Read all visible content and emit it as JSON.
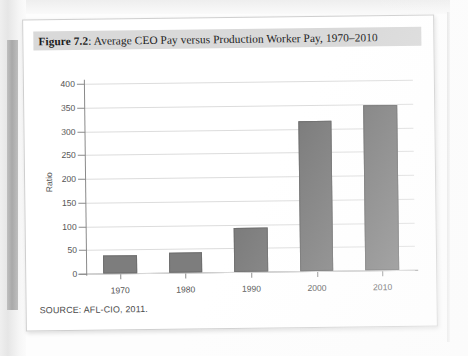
{
  "figure": {
    "label": "Figure 7.2",
    "separator": ": ",
    "caption": "Average CEO Pay versus Production Worker Pay, 1970–2010",
    "source": "SOURCE: AFL-CIO, 2011."
  },
  "colors": {
    "bar_fill": "#7d7d7d",
    "bar_edge": "#6f6f6f",
    "axis": "#8a8a8a",
    "gridline": "#dcdcdc",
    "caption_band": "#d9d9d9",
    "page": "#ffffff"
  },
  "chart_data": {
    "type": "bar",
    "title": "Average CEO Pay versus Production Worker Pay, 1970–2010",
    "xlabel": "",
    "ylabel": "Ratio",
    "categories": [
      "1970",
      "1980",
      "1990",
      "2000",
      "2010"
    ],
    "values": [
      38,
      42,
      93,
      315,
      348
    ],
    "ylim": [
      0,
      400
    ],
    "ytick_values": [
      0,
      50,
      100,
      150,
      200,
      250,
      300,
      350,
      400
    ],
    "ytick_labels": [
      "0",
      "50",
      "100",
      "150",
      "200",
      "250",
      "300",
      "350",
      "400"
    ],
    "grid": true,
    "legend": false,
    "legend_position": "none"
  }
}
